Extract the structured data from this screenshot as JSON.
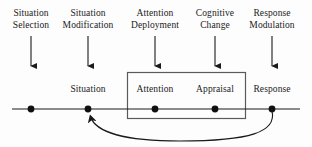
{
  "figure": {
    "type": "process-model-diagram",
    "background_color": "#fdfdfd",
    "ink_color": "#1a1a1a",
    "box_stroke_color": "#555555",
    "width": 312,
    "height": 147
  },
  "regulation_stages": [
    {
      "line1": "Situation",
      "line2": "Selection",
      "x": 31,
      "arrow_top": 36,
      "arrow_bottom": 69
    },
    {
      "line1": "Situation",
      "line2": "Modification",
      "x": 88,
      "arrow_top": 36,
      "arrow_bottom": 69
    },
    {
      "line1": "Attention",
      "line2": "Deployment",
      "x": 155,
      "arrow_top": 36,
      "arrow_bottom": 69
    },
    {
      "line1": "Cognitive",
      "line2": "Change",
      "x": 215,
      "arrow_top": 36,
      "arrow_bottom": 69
    },
    {
      "line1": "Response",
      "line2": "Modulation",
      "x": 272,
      "arrow_top": 36,
      "arrow_bottom": 69
    }
  ],
  "timeline": {
    "y": 109,
    "x_start": 12,
    "x_end": 300,
    "nodes": [
      {
        "label": "",
        "x": 31,
        "has_label": false
      },
      {
        "label": "Situation",
        "x": 88,
        "has_label": true
      },
      {
        "label": "Attention",
        "x": 155,
        "has_label": true
      },
      {
        "label": "Appraisal",
        "x": 215,
        "has_label": true
      },
      {
        "label": "Response",
        "x": 272,
        "has_label": true
      }
    ],
    "node_label_y": 84
  },
  "emotion_box": {
    "x": 127,
    "y": 72,
    "width": 119,
    "height": 47
  },
  "feedback_arrow": {
    "from_x": 272,
    "from_y": 110,
    "to_x": 89,
    "to_y": 113,
    "dip_y": 143
  }
}
